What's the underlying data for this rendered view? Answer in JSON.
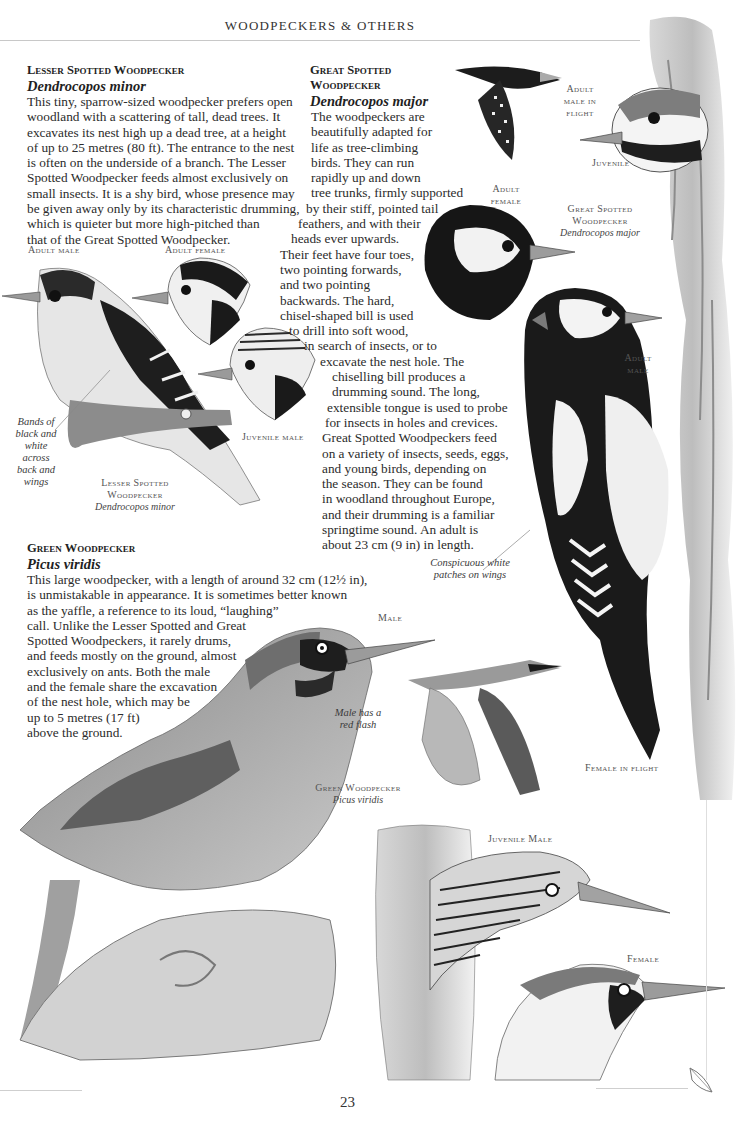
{
  "page": {
    "running_head": "WOODPECKERS & OTHERS",
    "page_number": "23"
  },
  "species": [
    {
      "id": "lesser-spotted",
      "common_name": "Lesser Spotted Woodpecker",
      "latin_name": "Dendrocopos minor",
      "body_lines": [
        "This tiny, sparrow-sized woodpecker prefers open",
        "woodland with a scattering of tall, dead trees. It",
        "excavates its nest high up a dead tree, at a height",
        "of up to 25 metres (80 ft). The entrance to the nest",
        "is often on the underside of a branch. The Lesser",
        "Spotted Woodpecker feeds almost exclusively on",
        "small insects. It is a shy bird, whose presence may",
        "be given away only by its characteristic drumming,",
        "which is quieter but more high-pitched than",
        "that of the Great Spotted Woodpecker."
      ]
    },
    {
      "id": "great-spotted",
      "common_name_lines": [
        "Great Spotted",
        "Woodpecker"
      ],
      "latin_name": "Dendrocopos major",
      "body_lines": [
        "The woodpeckers are",
        "beautifully adapted for",
        "life as tree-climbing",
        "birds. They can run",
        "rapidly up and down",
        "tree trunks, firmly supported",
        "by their stiff, pointed tail",
        "feathers, and with their",
        "heads ever upwards.",
        "Their feet have four toes,",
        "two pointing forwards,",
        "and two pointing",
        "backwards. The hard,",
        "chisel-shaped bill is used",
        "to drill into soft wood,",
        "in search of insects, or to",
        "excavate the nest hole. The",
        "chiselling bill produces a",
        "drumming sound. The long,",
        "extensible tongue is used to probe",
        "for insects in holes and crevices.",
        "Great Spotted Woodpeckers feed",
        "on a variety of insects, seeds, eggs,",
        "and young birds, depending on",
        "the season. They can be found",
        "in woodland throughout Europe,",
        "and their drumming is a familiar",
        "springtime sound. An adult is",
        "about 23 cm (9 in) in length."
      ]
    },
    {
      "id": "green",
      "common_name": "Green Woodpecker",
      "latin_name": "Picus viridis",
      "body_lines": [
        "This large woodpecker, with a length of around 32 cm (12½ in),",
        "is unmistakable in appearance. It is sometimes better known",
        "as the yaffle, a reference to its loud, “laughing”",
        "call. Unlike the Lesser Spotted and Great",
        "Spotted Woodpeckers, it rarely drums,",
        "and feeds mostly on the ground, almost",
        "exclusively on ants. Both the male",
        "and the female share the excavation",
        "of the nest hole, which may be",
        "up to 5 metres (17 ft)",
        "above the ground."
      ]
    }
  ],
  "captions": {
    "lesser_adult_male": "Adult male",
    "lesser_adult_female": "Adult female",
    "lesser_juvenile_male": "Juvenile male",
    "lesser_plate_name_1": "Lesser Spotted",
    "lesser_plate_name_2": "Woodpecker",
    "lesser_plate_latin": "Dendrocopos minor",
    "lesser_note_lines": [
      "Bands of",
      "black and",
      "white across",
      "back and",
      "wings"
    ],
    "great_adult_male_flight_lines": [
      "Adult",
      "male in",
      "flight"
    ],
    "great_juvenile": "Juvenile",
    "great_plate_name_1": "Great Spotted",
    "great_plate_name_2": "Woodpecker",
    "great_plate_latin": "Dendrocopos major",
    "great_adult_female_lines": [
      "Adult",
      "female"
    ],
    "great_adult_male_lines": [
      "Adult",
      "male"
    ],
    "great_note_lines": [
      "Conspicuous white",
      "patches on wings"
    ],
    "green_male": "Male",
    "green_note_lines": [
      "Male has a",
      "red flash"
    ],
    "green_female_flight": "Female in flight",
    "green_plate_name": "Green Woodpecker",
    "green_plate_latin": "Picus viridis",
    "green_juvenile_male": "Juvenile Male",
    "green_female": "Female"
  },
  "palette": {
    "ink": "#2b2b2b",
    "caption_gray": "#555555",
    "rule_gray": "#c8c8c8",
    "paper": "#ffffff"
  }
}
